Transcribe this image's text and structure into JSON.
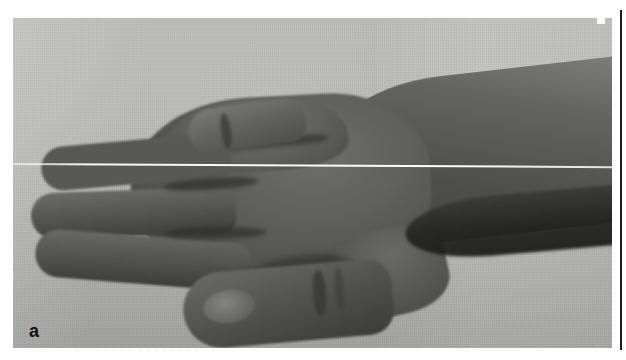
{
  "figure": {
    "panel_letter": "a",
    "caption": "",
    "media_type": "clinical photograph",
    "orientation": "hand to the left, forearm to the upper right",
    "background": "light gray textured cloth drape",
    "artifacts": [
      {
        "name": "scan-line",
        "type": "bright horizontal scanning artifact",
        "description": "thin white horizontal line crossing the full width of the photograph, slightly sloped downward to the right"
      },
      {
        "name": "corner-notch",
        "type": "white notch",
        "description": "small white rectangular notch at the upper right edge of the printed photograph"
      }
    ],
    "anatomy_labels": [
      "forearm",
      "dorsum of hand",
      "knuckle row",
      "index finger",
      "middle finger",
      "ring finger",
      "flexed digit over dorsum",
      "broad thumb",
      "thumb nail",
      "first web space"
    ]
  },
  "layout": {
    "adjacent_panel_edge": "thin dark vertical rule at the right margin marking the border of the neighbouring figure panel",
    "page_background": "white"
  },
  "colors": {
    "page_background": "#fefefe",
    "drape_background": "#b9b9b8",
    "skin_midtone": "#585857",
    "skin_highlight": "#7d7d7b",
    "skin_shadow": "#2e2e2d",
    "panel_letter": "#111111",
    "panel_rule": "#1c1c1c",
    "scan_line": "#ffffff"
  }
}
